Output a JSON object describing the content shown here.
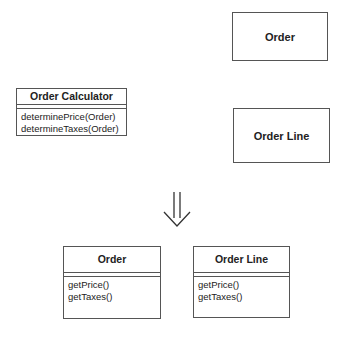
{
  "before": {
    "calculator": {
      "name": "Order Calculator",
      "methods": [
        "determinePrice(Order)",
        "determineTaxes(Order)"
      ]
    },
    "order": {
      "name": "Order"
    },
    "order_line": {
      "name": "Order Line"
    }
  },
  "transition": {
    "icon": "double-down-arrow-icon"
  },
  "after": {
    "order": {
      "name": "Order",
      "methods": [
        "getPrice()",
        "getTaxes()"
      ]
    },
    "order_line": {
      "name": "Order Line",
      "methods": [
        "getPrice()",
        "getTaxes()"
      ]
    }
  }
}
